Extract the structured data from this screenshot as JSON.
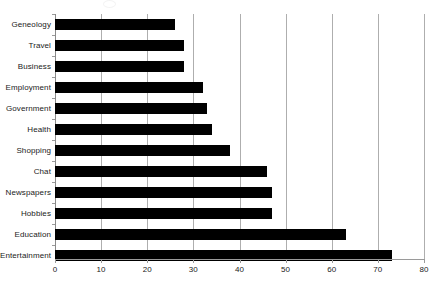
{
  "chart_data": {
    "type": "bar",
    "orientation": "horizontal",
    "title": "",
    "subtitle": "",
    "xlabel": "",
    "ylabel": "",
    "xlim": [
      0,
      80
    ],
    "xticks": [
      0,
      10,
      20,
      30,
      40,
      50,
      60,
      70,
      80
    ],
    "grid": true,
    "grid_axis": "x",
    "legend": false,
    "legend_position": "none",
    "bar_color": "#000000",
    "categories": [
      "Geneology",
      "Travel",
      "Business",
      "Employment",
      "Government",
      "Health",
      "Shopping",
      "Chat",
      "Newspapers",
      "Hobbies",
      "Education",
      "Entertainment"
    ],
    "values": [
      26,
      28,
      28,
      32,
      33,
      34,
      38,
      46,
      47,
      47,
      63,
      73
    ]
  },
  "axis": {
    "tick_labels": [
      "0",
      "10",
      "20",
      "30",
      "40",
      "50",
      "60",
      "70",
      "80"
    ]
  }
}
